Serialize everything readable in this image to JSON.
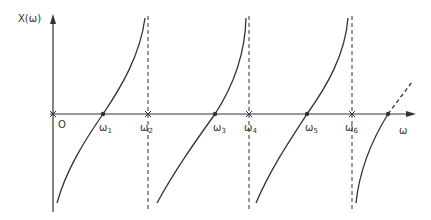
{
  "diagram": {
    "y_axis_label": "X(ω)",
    "x_axis_label": "ω",
    "origin_label": "O",
    "zeros": [
      {
        "name": "ω",
        "sub": "1"
      },
      {
        "name": "ω",
        "sub": "3"
      },
      {
        "name": "ω",
        "sub": "5"
      }
    ],
    "poles": [
      {
        "name": "ω",
        "sub": "2"
      },
      {
        "name": "ω",
        "sub": "4"
      },
      {
        "name": "ω",
        "sub": "6"
      }
    ],
    "colors": {
      "line": "#333333",
      "background": "#ffffff"
    }
  }
}
